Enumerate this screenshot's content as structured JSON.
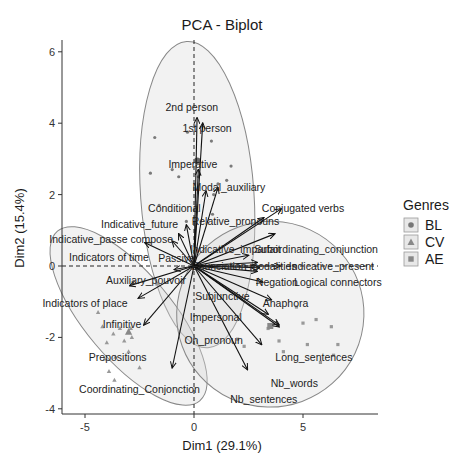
{
  "chart_data": {
    "type": "scatter",
    "subtype": "pca-biplot",
    "title": "PCA - Biplot",
    "xlabel": "Dim1 (29.1%)",
    "ylabel": "Dim2 (15.4%)",
    "xlim": [
      -6.1,
      8.5
    ],
    "ylim": [
      -4.1,
      6.2
    ],
    "xticks": [
      -5,
      0,
      5
    ],
    "yticks": [
      -4,
      -2,
      0,
      2,
      4,
      6
    ],
    "grid": false,
    "legend": {
      "title": "Genres",
      "position": "right",
      "entries": [
        {
          "label": "BL",
          "shape": "circle"
        },
        {
          "label": "CV",
          "shape": "triangle"
        },
        {
          "label": "AE",
          "shape": "square"
        }
      ]
    },
    "ellipses": [
      {
        "group": "BL",
        "cx": 0.15,
        "cy": 2.0,
        "rx": 2.6,
        "ry": 4.3,
        "angle": -4
      },
      {
        "group": "CV",
        "cx": -3.0,
        "cy": -1.4,
        "rx": 2.0,
        "ry": 3.1,
        "angle": -40
      },
      {
        "group": "AE",
        "cx": 3.5,
        "cy": -1.35,
        "rx": 4.3,
        "ry": 2.6,
        "angle": -20
      }
    ],
    "variables": [
      {
        "name": "2nd person",
        "x": 0.14,
        "y": 4.15,
        "lx": -0.1,
        "ly": 4.45
      },
      {
        "name": "1st person",
        "x": 0.4,
        "y": 4.0,
        "lx": 0.6,
        "ly": 3.85
      },
      {
        "name": "Imperative",
        "x": 0.2,
        "y": 2.7,
        "lx": -0.05,
        "ly": 2.85
      },
      {
        "name": "Modal_auxiliary",
        "x": 1.1,
        "y": 2.2,
        "lx": 1.6,
        "ly": 2.2
      },
      {
        "name": "Conditional",
        "x": 0.55,
        "y": 2.1,
        "lx": -0.9,
        "ly": 1.6
      },
      {
        "name": "Conjugated verbs",
        "x": 4.0,
        "y": 1.6,
        "lx": 5.0,
        "ly": 1.6
      },
      {
        "name": "Relative_pronouns",
        "x": 3.2,
        "y": 1.35,
        "lx": 1.9,
        "ly": 1.25
      },
      {
        "name": "Indicative_future",
        "x": -0.35,
        "y": 1.15,
        "lx": -2.5,
        "ly": 1.15
      },
      {
        "name": "Indicative_passe compose",
        "x": -0.7,
        "y": 0.9,
        "lx": -3.8,
        "ly": 0.75
      },
      {
        "name": "Indicative_imparfait",
        "x": 2.5,
        "y": 0.3,
        "lx": 1.9,
        "ly": 0.45
      },
      {
        "name": "Subordinating_conjunction",
        "x": 3.7,
        "y": 0.9,
        "lx": 5.6,
        "ly": 0.45
      },
      {
        "name": "Indicators of time",
        "x": -2.25,
        "y": 0.65,
        "lx": -3.9,
        "ly": 0.25
      },
      {
        "name": "Passive",
        "x": -1.0,
        "y": 0.7,
        "lx": -0.8,
        "ly": 0.2
      },
      {
        "name": "Enunciation modalities",
        "x": 2.9,
        "y": 0.1,
        "lx": 2.3,
        "ly": 0.0
      },
      {
        "name": "Indicative_present",
        "x": 3.95,
        "y": 0.0,
        "lx": 6.3,
        "ly": 0.0
      },
      {
        "name": "Negation",
        "x": 3.0,
        "y": -0.05,
        "lx": 3.8,
        "ly": -0.45
      },
      {
        "name": "Logical connectors",
        "x": 2.9,
        "y": -0.15,
        "lx": 6.6,
        "ly": -0.45
      },
      {
        "name": "Auxiliary_pouvoir",
        "x": -0.9,
        "y": -0.1,
        "lx": -2.2,
        "ly": -0.4
      },
      {
        "name": "Subjunctive",
        "x": 3.15,
        "y": -0.45,
        "lx": 1.3,
        "ly": -0.85
      },
      {
        "name": "Anaphora",
        "x": 3.55,
        "y": -0.95,
        "lx": 4.2,
        "ly": -1.05
      },
      {
        "name": "Indicators of place",
        "x": -2.95,
        "y": -0.55,
        "lx": -5.0,
        "ly": -1.05
      },
      {
        "name": "Impersonal",
        "x": 3.4,
        "y": -1.35,
        "lx": 1.0,
        "ly": -1.45
      },
      {
        "name": "Infinitive",
        "x": -2.55,
        "y": -0.9,
        "lx": -3.3,
        "ly": -1.65
      },
      {
        "name": "On_pronoun",
        "x": 3.9,
        "y": -1.7,
        "lx": 0.9,
        "ly": -2.1
      },
      {
        "name": "Long_sentences",
        "x": 3.9,
        "y": -1.65,
        "lx": 5.5,
        "ly": -2.55
      },
      {
        "name": "Prepositions",
        "x": -2.3,
        "y": -1.65,
        "lx": -3.5,
        "ly": -2.55
      },
      {
        "name": "Nb_words",
        "x": 3.1,
        "y": -2.2,
        "lx": 4.6,
        "ly": -3.3
      },
      {
        "name": "Coordinating_Conjonction",
        "x": -1.0,
        "y": -2.85,
        "lx": -2.5,
        "ly": -3.45
      },
      {
        "name": "Nb_sentences",
        "x": 2.45,
        "y": -2.9,
        "lx": 3.2,
        "ly": -3.75
      }
    ],
    "individuals": {
      "BL": [
        [
          -1.8,
          3.6
        ],
        [
          -0.3,
          3.75
        ],
        [
          -2.0,
          2.6
        ],
        [
          1.5,
          2.4
        ],
        [
          1.7,
          2.8
        ],
        [
          -1.0,
          2.7
        ],
        [
          0.8,
          3.5
        ],
        [
          -1.6,
          1.7
        ],
        [
          -0.7,
          2.5
        ],
        [
          0.2,
          2.5
        ],
        [
          0.9,
          2.0
        ],
        [
          -0.35,
          1.25
        ],
        [
          0.85,
          1.45
        ],
        [
          1.1,
          2.3
        ]
      ],
      "CV": [
        [
          -4.4,
          -1.3
        ],
        [
          -4.2,
          -1.7
        ],
        [
          -3.7,
          -1.9
        ],
        [
          -3.2,
          -2.1
        ],
        [
          -3.4,
          -1.75
        ],
        [
          -2.85,
          -2.0
        ],
        [
          -4.0,
          -2.15
        ],
        [
          -3.0,
          -2.4
        ],
        [
          -3.6,
          -2.55
        ],
        [
          -2.5,
          -2.85
        ],
        [
          -3.9,
          -2.95
        ],
        [
          -2.9,
          -1.75
        ],
        [
          -3.0,
          -1.85
        ],
        [
          -4.1,
          -2.6
        ],
        [
          -3.65,
          -3.2
        ],
        [
          -1.7,
          -0.5
        ]
      ],
      "AE": [
        [
          3.4,
          -1.75
        ],
        [
          3.9,
          -2.1
        ],
        [
          5.6,
          -1.5
        ],
        [
          6.3,
          -1.7
        ],
        [
          5.2,
          -2.2
        ],
        [
          5.8,
          -2.7
        ],
        [
          6.4,
          -2.5
        ],
        [
          4.1,
          -2.4
        ],
        [
          2.0,
          -2.05
        ],
        [
          2.3,
          -2.25
        ],
        [
          4.7,
          -1.15
        ],
        [
          6.6,
          -2.2
        ],
        [
          5.0,
          -1.6
        ]
      ]
    }
  }
}
